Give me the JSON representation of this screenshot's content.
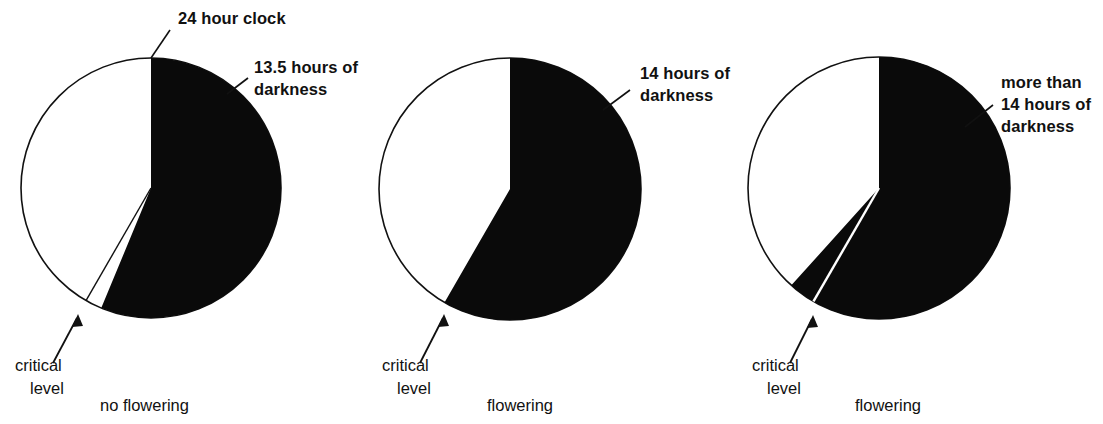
{
  "figure": {
    "title_text": "",
    "background": "#ffffff",
    "ink": "#111111"
  },
  "chart_data": {
    "type": "pie",
    "title": "",
    "xlabel": "",
    "ylabel": "",
    "note": "Three 24-hour clock pie diagrams showing length of dark period relative to a critical level; black slice = darkness, white slice = light.",
    "panels": [
      {
        "id": "panel-1",
        "categories": [
          "hours of darkness",
          "hours of light"
        ],
        "values": [
          13.5,
          10.5
        ],
        "units": "hours",
        "total": 24,
        "dark_hours": 13.5,
        "critical_level_hours": 14,
        "dark_label": "13.5 hours of\ndarkness",
        "dark_label_line1": "13.5 hours of",
        "dark_label_line2": "darkness",
        "clock_label": "24 hour clock",
        "critical_label_line1": "critical",
        "critical_label_line2": "level",
        "caption": "no flowering",
        "dark_start_deg": 0,
        "dark_end_deg": 202.5,
        "critical_deg": 210
      },
      {
        "id": "panel-2",
        "categories": [
          "hours of darkness",
          "hours of light"
        ],
        "values": [
          14,
          10
        ],
        "units": "hours",
        "total": 24,
        "dark_hours": 14,
        "critical_level_hours": 14,
        "dark_label": "14 hours of\ndarkness",
        "dark_label_line1": "14 hours of",
        "dark_label_line2": "darkness",
        "critical_label_line1": "critical",
        "critical_label_line2": "level",
        "caption": "flowering",
        "dark_start_deg": 0,
        "dark_end_deg": 210,
        "critical_deg": 210
      },
      {
        "id": "panel-3",
        "categories": [
          "hours of darkness",
          "hours of light"
        ],
        "values": [
          15,
          9
        ],
        "units": "hours",
        "total": 24,
        "dark_hours": 15,
        "critical_level_hours": 14,
        "dark_label": "more than\n14 hours of\ndarkness",
        "dark_label_line1": "more than",
        "dark_label_line2": "14 hours of",
        "dark_label_line3": "darkness",
        "critical_label_line1": "critical",
        "critical_label_line2": "level",
        "caption": "flowering",
        "dark_start_deg": 0,
        "dark_end_deg": 222,
        "critical_deg": 210
      }
    ]
  },
  "labels": {
    "clock": "24 hour clock",
    "critical_line1": "critical",
    "critical_line2": "level",
    "p1_dark_l1": "13.5 hours of",
    "p1_dark_l2": "darkness",
    "p2_dark_l1": "14 hours of",
    "p2_dark_l2": "darkness",
    "p3_dark_l1": "more than",
    "p3_dark_l2": "14 hours of",
    "p3_dark_l3": "darkness",
    "p1_caption": "no flowering",
    "p2_caption": "flowering",
    "p3_caption": "flowering"
  }
}
